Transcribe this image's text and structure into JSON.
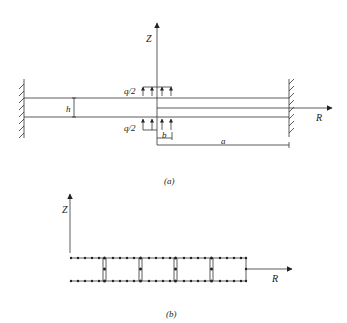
{
  "figure_a": {
    "caption": "(a)",
    "axis_z_label": "Z",
    "axis_r_label": "R",
    "load_top_label": "q/2",
    "load_bottom_label": "q/2",
    "thickness_label": "h",
    "load_width_label": "b",
    "radius_label": "a"
  },
  "figure_b": {
    "caption": "(b)",
    "axis_z_label": "Z",
    "axis_r_label": "R"
  },
  "colors": {
    "line": "#333333",
    "background": "#ffffff"
  }
}
